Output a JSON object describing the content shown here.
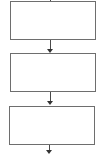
{
  "diagram": {
    "type": "flowchart",
    "direction": "top-to-bottom",
    "colors": {
      "box_border": "#6e6e6e",
      "box_fill": "#ffffff",
      "arrow": "#333333"
    },
    "nodes": [
      {
        "id": "step-1",
        "label": ""
      },
      {
        "id": "step-2",
        "label": ""
      },
      {
        "id": "step-3",
        "label": ""
      }
    ],
    "edges": [
      {
        "from": "incoming",
        "to": "step-1"
      },
      {
        "from": "step-1",
        "to": "step-2"
      },
      {
        "from": "step-2",
        "to": "step-3"
      },
      {
        "from": "step-3",
        "to": "outgoing"
      }
    ]
  }
}
